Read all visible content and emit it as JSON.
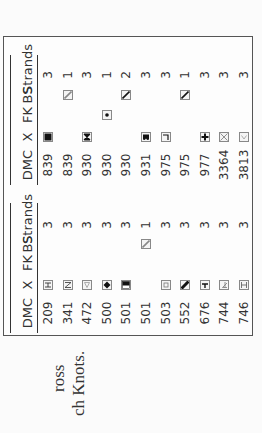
{
  "table": {
    "left_group": {
      "headers": {
        "dmc": "DMC",
        "x": "X",
        "fk": "FK",
        "bs": "BS",
        "strands": "Strands"
      },
      "rows": [
        {
          "dmc": "209",
          "x": "h-bar-icon",
          "fk": "",
          "bs": "",
          "strands": "3"
        },
        {
          "dmc": "341",
          "x": "letter-n-icon",
          "fk": "",
          "bs": "",
          "strands": "3"
        },
        {
          "dmc": "472",
          "x": "triangle-outline-icon",
          "fk": "",
          "bs": "",
          "strands": "3"
        },
        {
          "dmc": "500",
          "x": "diamond-filled-icon",
          "fk": "",
          "bs": "",
          "strands": "3"
        },
        {
          "dmc": "501",
          "x": "half-filled-square-icon",
          "fk": "",
          "bs": "",
          "strands": "3"
        },
        {
          "dmc": "501",
          "x": "",
          "fk": "",
          "bs": "backstitch-light-icon",
          "strands": "1"
        },
        {
          "dmc": "503",
          "x": "small-square-outline-icon",
          "fk": "",
          "bs": "",
          "strands": "3"
        },
        {
          "dmc": "552",
          "x": "thick-diagonal-icon",
          "fk": "",
          "bs": "",
          "strands": "3"
        },
        {
          "dmc": "676",
          "x": "t-shape-icon",
          "fk": "",
          "bs": "",
          "strands": "3"
        },
        {
          "dmc": "744",
          "x": "digit-four-icon",
          "fk": "",
          "bs": "",
          "strands": "3"
        },
        {
          "dmc": "746",
          "x": "letter-h-icon",
          "fk": "",
          "bs": "",
          "strands": "3"
        }
      ]
    },
    "right_group": {
      "headers": {
        "dmc": "DMC",
        "x": "X",
        "fk": "FK",
        "bs": "BS",
        "strands": "Strands"
      },
      "rows": [
        {
          "dmc": "839",
          "x": "filled-square-icon",
          "fk": "",
          "bs": "",
          "strands": "3"
        },
        {
          "dmc": "839",
          "x": "",
          "fk": "",
          "bs": "backstitch-light-icon",
          "strands": "1"
        },
        {
          "dmc": "930",
          "x": "bowtie-icon",
          "fk": "",
          "bs": "",
          "strands": "3"
        },
        {
          "dmc": "930",
          "x": "",
          "fk": "french-knot-dot-icon",
          "bs": "",
          "strands": "1"
        },
        {
          "dmc": "930",
          "x": "",
          "fk": "",
          "bs": "backstitch-dark-icon",
          "strands": "2"
        },
        {
          "dmc": "931",
          "x": "heart-filled-icon",
          "fk": "",
          "bs": "",
          "strands": "3"
        },
        {
          "dmc": "975",
          "x": "corner-l-icon",
          "fk": "",
          "bs": "",
          "strands": "3"
        },
        {
          "dmc": "975",
          "x": "",
          "fk": "",
          "bs": "backstitch-dark-icon",
          "strands": "1"
        },
        {
          "dmc": "977",
          "x": "plus-filled-icon",
          "fk": "",
          "bs": "",
          "strands": "3"
        },
        {
          "dmc": "3364",
          "x": "x-outline-icon",
          "fk": "",
          "bs": "",
          "strands": "3"
        },
        {
          "dmc": "3813",
          "x": "chevron-outline-icon",
          "fk": "",
          "bs": "",
          "strands": "3"
        }
      ]
    }
  },
  "footer": {
    "line1": "ross",
    "line2": "ch Knots."
  }
}
